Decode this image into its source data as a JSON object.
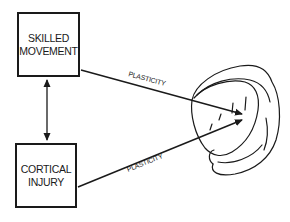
{
  "diagram": {
    "nodes": [
      {
        "id": "skilled-movement",
        "lines": [
          "SKILLED",
          "MOVEMENT"
        ]
      },
      {
        "id": "cortical-injury",
        "lines": [
          "CORTICAL",
          "INJURY"
        ]
      },
      {
        "id": "brain",
        "label": "",
        "shape": "brain-cortex-sketch"
      }
    ],
    "edges": [
      {
        "from": "skilled-movement",
        "to": "cortical-injury",
        "label": "",
        "type": "bidirectional"
      },
      {
        "from": "skilled-movement",
        "to": "brain",
        "label": "PLASTICITY",
        "type": "directed"
      },
      {
        "from": "cortical-injury",
        "to": "brain",
        "label": "PLASTICITY",
        "type": "directed"
      }
    ]
  },
  "colors": {
    "ink": "#1a1a1a",
    "background": "#ffffff"
  }
}
